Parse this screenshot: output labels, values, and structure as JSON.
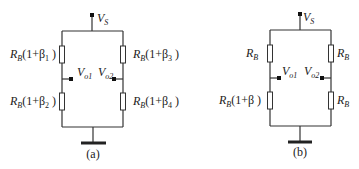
{
  "circuits": [
    {
      "id": "a",
      "caption": "(a)",
      "supply": {
        "symbol": "V",
        "sub": "S"
      },
      "outputs": [
        {
          "symbol": "V",
          "sub": "o1"
        },
        {
          "symbol": "V",
          "sub": "o2"
        }
      ],
      "resistors": [
        {
          "position": "top-left",
          "base": "R",
          "base_sub": "B",
          "factor": "(1+β",
          "factor_sub": "1",
          "close": " )"
        },
        {
          "position": "bottom-left",
          "base": "R",
          "base_sub": "B",
          "factor": "(1+β",
          "factor_sub": "2",
          "close": " )"
        },
        {
          "position": "top-right",
          "base": "R",
          "base_sub": "B",
          "factor": "(1+β",
          "factor_sub": "3",
          "close": " )"
        },
        {
          "position": "bottom-right",
          "base": "R",
          "base_sub": "B",
          "factor": "(1+β",
          "factor_sub": "4",
          "close": " )"
        }
      ]
    },
    {
      "id": "b",
      "caption": "(b)",
      "supply": {
        "symbol": "V",
        "sub": "S"
      },
      "outputs": [
        {
          "symbol": "V",
          "sub": "o1"
        },
        {
          "symbol": "V",
          "sub": "o2"
        }
      ],
      "resistors": [
        {
          "position": "top-left",
          "base": "R",
          "base_sub": "B",
          "factor": "",
          "factor_sub": "",
          "close": ""
        },
        {
          "position": "bottom-left",
          "base": "R",
          "base_sub": "B",
          "factor": "(1+β",
          "factor_sub": "",
          "close": " )"
        },
        {
          "position": "top-right",
          "base": "R",
          "base_sub": "B",
          "factor": "",
          "factor_sub": "",
          "close": ""
        },
        {
          "position": "bottom-right",
          "base": "R",
          "base_sub": "B",
          "factor": "",
          "factor_sub": "",
          "close": ""
        }
      ]
    }
  ]
}
